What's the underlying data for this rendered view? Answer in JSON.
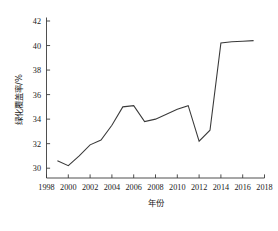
{
  "chart_data": {
    "type": "line",
    "title": "",
    "xlabel": "年份",
    "ylabel": "绿化覆盖率/%",
    "xlim": [
      1998,
      2018
    ],
    "ylim": [
      29.2,
      42
    ],
    "grid": false,
    "legend": null,
    "xticks": [
      1998,
      2000,
      2002,
      2004,
      2006,
      2008,
      2010,
      2012,
      2014,
      2016,
      2018
    ],
    "yticks": [
      30,
      32,
      34,
      36,
      38,
      40,
      42
    ],
    "xtick_labels": [
      "1998",
      "2000",
      "2002",
      "2004",
      "2006",
      "2008",
      "2010",
      "2012",
      "2014",
      "2016",
      "2018"
    ],
    "ytick_labels": [
      "30",
      "32",
      "34",
      "36",
      "38",
      "40",
      "42"
    ],
    "line_color": "#3a3a3a",
    "series": [
      {
        "name": "绿化覆盖率",
        "x": [
          1999,
          2000,
          2001,
          2002,
          2003,
          2004,
          2005,
          2006,
          2007,
          2008,
          2009,
          2010,
          2011,
          2012,
          2013,
          2014,
          2015,
          2016,
          2017
        ],
        "values": [
          30.6,
          30.2,
          31.0,
          31.9,
          32.3,
          33.5,
          35.0,
          35.1,
          33.8,
          34.0,
          34.4,
          34.8,
          35.1,
          32.2,
          33.1,
          40.2,
          40.3,
          40.35,
          40.4
        ]
      }
    ]
  }
}
